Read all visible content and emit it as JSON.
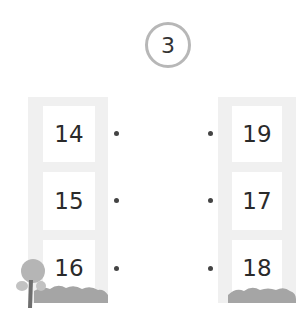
{
  "badge": {
    "number": "3"
  },
  "left_column": {
    "items": [
      {
        "value": "14"
      },
      {
        "value": "15"
      },
      {
        "value": "16"
      }
    ]
  },
  "right_column": {
    "items": [
      {
        "value": "19"
      },
      {
        "value": "17"
      },
      {
        "value": "18"
      }
    ]
  },
  "colors": {
    "panel": "#f0f0f0",
    "badge_ring": "#b7b7b7",
    "ground": "#a5a5a5",
    "text": "#2a2a2a"
  }
}
